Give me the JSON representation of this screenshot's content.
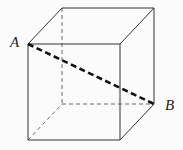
{
  "diagram": {
    "type": "cube",
    "labels": {
      "A": "A",
      "B": "B"
    },
    "vertices": {
      "front_top_left": [
        28,
        44
      ],
      "front_top_right": [
        120,
        44
      ],
      "front_bottom_left": [
        28,
        140
      ],
      "front_bottom_right": [
        120,
        140
      ],
      "back_top_left": [
        62,
        8
      ],
      "back_top_right": [
        154,
        8
      ],
      "back_bottom_left": [
        62,
        104
      ],
      "back_bottom_right": [
        154,
        104
      ]
    },
    "diagonal": {
      "from": "A",
      "to": "B",
      "style": "thick-dashed"
    },
    "colors": {
      "edge": "#333333",
      "diagonal": "#111111"
    }
  }
}
